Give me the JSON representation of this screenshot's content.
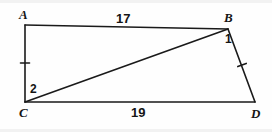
{
  "figure": {
    "type": "geometry-diagram",
    "shape": "quadrilateral-with-diagonal",
    "stroke_color": "#1a1a1a",
    "background_color": "#fefefe",
    "vertices": [
      {
        "name": "A",
        "label": "A",
        "x": 25,
        "y": 25,
        "label_x": 19,
        "label_y": 8
      },
      {
        "name": "B",
        "label": "B",
        "x": 228,
        "y": 29,
        "label_x": 224,
        "label_y": 11
      },
      {
        "name": "C",
        "label": "C",
        "x": 25,
        "y": 102,
        "label_x": 19,
        "label_y": 106
      },
      {
        "name": "D",
        "label": "D",
        "x": 255,
        "y": 102,
        "label_x": 251,
        "label_y": 107
      }
    ],
    "segments": [
      {
        "name": "AB",
        "from": "A",
        "to": "B"
      },
      {
        "name": "AC",
        "from": "A",
        "to": "C"
      },
      {
        "name": "CD",
        "from": "C",
        "to": "D"
      },
      {
        "name": "BD",
        "from": "B",
        "to": "D"
      },
      {
        "name": "CB",
        "from": "C",
        "to": "B",
        "role": "diagonal"
      }
    ],
    "side_labels": [
      {
        "name": "AB",
        "text": "17",
        "x": 116,
        "y": 12
      },
      {
        "name": "CD",
        "text": "19",
        "x": 131,
        "y": 106
      }
    ],
    "angle_labels": [
      {
        "name": "angle-1-at-B",
        "text": "1",
        "x": 225,
        "y": 33
      },
      {
        "name": "angle-2-at-C",
        "text": "2",
        "x": 30,
        "y": 83
      }
    ],
    "tick_marks": [
      {
        "name": "tick-AC",
        "segment": "AC",
        "x": 25,
        "y": 63
      },
      {
        "name": "tick-BD",
        "segment": "BD",
        "x": 242,
        "y": 65
      }
    ]
  }
}
